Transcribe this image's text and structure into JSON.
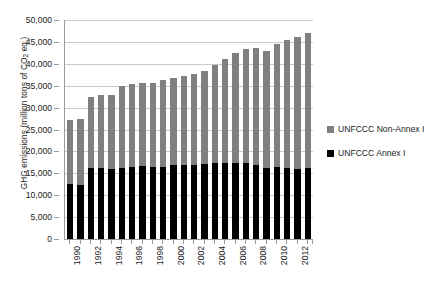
{
  "chart_data": {
    "type": "bar",
    "subtype": "stacked-bar",
    "title": "",
    "xlabel": "",
    "ylabel": "GHG emissions (million tons of CO2 eq.)",
    "ylabel_parts": {
      "before": "GHG emissions (million tons of CO",
      "sub": "2",
      "after": " eq.)"
    },
    "ylim": [
      0,
      50000
    ],
    "ytick_step": 5000,
    "ytick_labels": [
      "0",
      "5,000",
      "10,000",
      "15,000",
      "20,000",
      "25,000",
      "30,000",
      "35,000",
      "40,000",
      "45,000",
      "50,000"
    ],
    "ytick_values": [
      0,
      5000,
      10000,
      15000,
      20000,
      25000,
      30000,
      35000,
      40000,
      45000,
      50000
    ],
    "grid": true,
    "grid_axis": "y",
    "legend_position": "right",
    "categories": [
      "1990",
      "1991",
      "1992",
      "1993",
      "1994",
      "1995",
      "1996",
      "1997",
      "1998",
      "1999",
      "2000",
      "2001",
      "2002",
      "2003",
      "2004",
      "2005",
      "2006",
      "2007",
      "2008",
      "2009",
      "2010",
      "2011",
      "2012",
      "2013"
    ],
    "xtick_labels_shown": [
      "1990",
      "1992",
      "1994",
      "1996",
      "1998",
      "2000",
      "2002",
      "2004",
      "2006",
      "2008",
      "2010",
      "2012"
    ],
    "series": [
      {
        "name": "UNFCCC Annex I",
        "color": "#000000",
        "values": [
          12500,
          12400,
          16200,
          16100,
          16000,
          16200,
          16500,
          16600,
          16500,
          16500,
          16800,
          16800,
          16900,
          17200,
          17400,
          17400,
          17300,
          17300,
          17000,
          16100,
          16500,
          16300,
          16000,
          16100
        ]
      },
      {
        "name": "UNFCCC Non-Annex I",
        "color": "#808080",
        "values": [
          14600,
          15100,
          16200,
          16700,
          16900,
          18800,
          18800,
          19100,
          19200,
          19700,
          20000,
          20400,
          20800,
          21100,
          22400,
          23600,
          25200,
          26100,
          26700,
          26800,
          28000,
          29100,
          30100,
          30900
        ]
      }
    ],
    "totals": [
      27100,
      27500,
      32400,
      32800,
      32900,
      35000,
      35300,
      35700,
      35700,
      36200,
      36800,
      37200,
      37700,
      38300,
      39800,
      41000,
      42500,
      43400,
      43700,
      42900,
      44500,
      45400,
      46100,
      47000
    ]
  },
  "legend": {
    "entries": [
      {
        "label": "UNFCCC Non-Annex I",
        "color": "#808080",
        "swatch_name": "legend-swatch-non-annex-i"
      },
      {
        "label": "UNFCCC Annex I",
        "color": "#000000",
        "swatch_name": "legend-swatch-annex-i"
      }
    ]
  },
  "colors": {
    "annex_i": "#000000",
    "non_annex_i": "#808080",
    "gridline": "#c9c9c9",
    "axis": "#9a9a9a",
    "background": "#ffffff",
    "text": "#1a1a1a"
  }
}
